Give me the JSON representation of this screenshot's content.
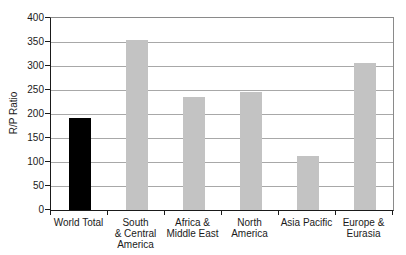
{
  "chart_data": {
    "type": "bar",
    "title": "",
    "xlabel": "",
    "ylabel": "R/P Ratio",
    "ylim": [
      0,
      400
    ],
    "yticks": [
      0,
      50,
      100,
      150,
      200,
      250,
      300,
      350,
      400
    ],
    "grid": true,
    "legend": false,
    "categories": [
      "World Total",
      "South & Central America",
      "Africa & Middle East",
      "North America",
      "Asia Pacific",
      "Europe & Eurasia"
    ],
    "category_label_lines": [
      [
        "World Total"
      ],
      [
        "South",
        "& Central",
        "America"
      ],
      [
        "Africa &",
        "Middle East"
      ],
      [
        "North",
        "America"
      ],
      [
        "Asia Pacific"
      ],
      [
        "Europe &",
        "Eurasia"
      ]
    ],
    "values": [
      192,
      355,
      236,
      246,
      113,
      306
    ],
    "bar_colors": [
      "#000000",
      "#c3c3c3",
      "#c3c3c3",
      "#c3c3c3",
      "#c3c3c3",
      "#c3c3c3"
    ],
    "style": {
      "bar_default": "#c3c3c3",
      "bar_highlight": "#000000",
      "gridline": "#a8a8a8",
      "axis": "#1a1a1a",
      "plot_border": "#8a8a8a",
      "background": "#ffffff",
      "text": "#1a1a1a"
    }
  }
}
